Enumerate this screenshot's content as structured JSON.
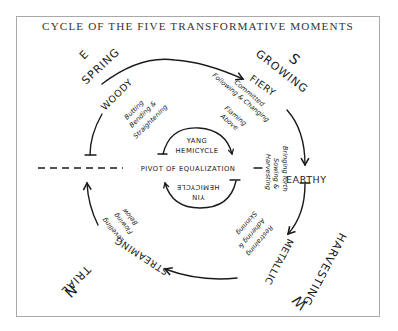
{
  "title": "CYCLE OF THE FIVE TRANSFORMATIVE MOMENTS",
  "directions": {
    "east": "E",
    "south": "S",
    "west": "W",
    "north": "N"
  },
  "seasons": {
    "spring": "SPRING",
    "growing": "GROWING",
    "harvesting": "HARVESTING",
    "trial": "TRIAL"
  },
  "phases": {
    "woody": {
      "label": "WOODY",
      "notes": [
        "Butting",
        "Bending &",
        "Straightening"
      ]
    },
    "fiery": {
      "label": "FIERY",
      "notes": [
        "Committed",
        "Following & Changing",
        "Flaming",
        "Above"
      ]
    },
    "earthy": {
      "label": "EARTHY",
      "notes": [
        "Bringing forth",
        "Sowing &",
        "Harvesting"
      ]
    },
    "metallic": {
      "label": "METALLIC",
      "notes": [
        "Restraining",
        "Adhering &",
        "Skinning"
      ]
    },
    "streaming": {
      "label": "STREAMING",
      "notes": [
        "Levelling",
        "Flowing",
        "Below"
      ]
    }
  },
  "center": {
    "yang_line1": "YANG",
    "yang_line2": "HEMICYCLE",
    "pivot": "PIVOT OF EQUALIZATION",
    "yin_line1": "YIN",
    "yin_line2": "HEMICYCLE"
  }
}
